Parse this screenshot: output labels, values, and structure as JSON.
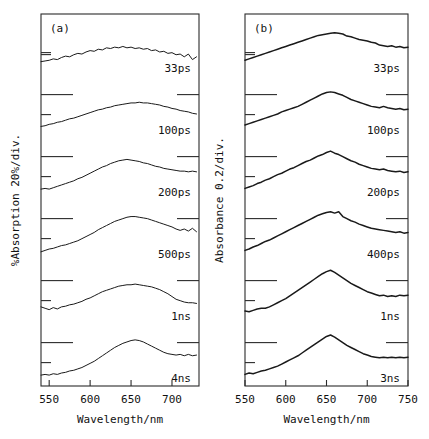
{
  "figure": {
    "background": "#ffffff",
    "ink": "#1a1a1a"
  },
  "chart_data": [
    {
      "type": "line",
      "panel_label": "(a)",
      "title": "",
      "xlabel": "Wavelength/nm",
      "ylabel": "%Absorption 20%/div.",
      "xlim": [
        540,
        733
      ],
      "xticks": [
        550,
        600,
        650,
        700
      ],
      "xticklabels": [
        "550",
        "600",
        "650",
        "700"
      ],
      "grid": false,
      "legend_position": "inline-right",
      "y_divisions": 6,
      "y_division_value": 20,
      "y_division_unit": "%",
      "series": [
        {
          "name": "33ps",
          "label": "33ps",
          "x": [
            540,
            545,
            550,
            555,
            560,
            565,
            570,
            575,
            580,
            585,
            590,
            595,
            600,
            605,
            610,
            615,
            620,
            625,
            630,
            635,
            640,
            645,
            650,
            655,
            660,
            665,
            670,
            675,
            680,
            685,
            690,
            695,
            700,
            705,
            710,
            715,
            720,
            725,
            730
          ],
          "values": [
            10,
            11,
            12,
            14,
            13,
            16,
            18,
            17,
            20,
            22,
            21,
            24,
            26,
            25,
            28,
            27,
            30,
            29,
            31,
            30,
            32,
            30,
            31,
            29,
            30,
            28,
            29,
            26,
            27,
            24,
            25,
            22,
            23,
            20,
            21,
            17,
            21,
            13,
            17
          ]
        },
        {
          "name": "100ps",
          "label": "100ps",
          "x": [
            540,
            545,
            550,
            555,
            560,
            565,
            570,
            575,
            580,
            585,
            590,
            595,
            600,
            605,
            610,
            615,
            620,
            625,
            630,
            635,
            640,
            645,
            650,
            655,
            660,
            665,
            670,
            675,
            680,
            685,
            690,
            695,
            700,
            705,
            710,
            715,
            720,
            725,
            730
          ],
          "values": [
            6,
            7,
            9,
            10,
            12,
            13,
            15,
            17,
            18,
            20,
            22,
            24,
            26,
            28,
            30,
            31,
            33,
            34,
            36,
            37,
            38,
            39,
            40,
            40,
            41,
            40,
            40,
            39,
            38,
            37,
            35,
            34,
            32,
            31,
            29,
            28,
            27,
            25,
            24
          ]
        },
        {
          "name": "200ps",
          "label": "200ps",
          "x": [
            540,
            545,
            550,
            555,
            560,
            565,
            570,
            575,
            580,
            585,
            590,
            595,
            600,
            605,
            610,
            615,
            620,
            625,
            630,
            635,
            640,
            645,
            650,
            655,
            660,
            665,
            670,
            675,
            680,
            685,
            690,
            695,
            700,
            705,
            710,
            715,
            720,
            725,
            730
          ],
          "values": [
            5,
            6,
            5,
            7,
            9,
            11,
            13,
            15,
            17,
            20,
            22,
            25,
            28,
            31,
            34,
            37,
            39,
            42,
            44,
            46,
            47,
            48,
            47,
            46,
            45,
            43,
            42,
            40,
            38,
            37,
            35,
            34,
            33,
            32,
            31,
            31,
            30,
            31,
            30
          ]
        },
        {
          "name": "500ps",
          "label": "500ps",
          "x": [
            540,
            545,
            550,
            555,
            560,
            565,
            570,
            575,
            580,
            585,
            590,
            595,
            600,
            605,
            610,
            615,
            620,
            625,
            630,
            635,
            640,
            645,
            650,
            655,
            660,
            665,
            670,
            675,
            680,
            685,
            690,
            695,
            700,
            705,
            710,
            715,
            720,
            725,
            730
          ],
          "values": [
            4,
            6,
            8,
            9,
            11,
            13,
            14,
            16,
            18,
            20,
            23,
            26,
            29,
            32,
            36,
            39,
            42,
            45,
            48,
            50,
            52,
            54,
            55,
            55,
            54,
            53,
            52,
            50,
            48,
            46,
            44,
            42,
            40,
            37,
            35,
            37,
            34,
            38,
            33
          ]
        },
        {
          "name": "1ns",
          "label": "1ns",
          "x": [
            540,
            545,
            550,
            555,
            560,
            565,
            570,
            575,
            580,
            585,
            590,
            595,
            600,
            605,
            610,
            615,
            620,
            625,
            630,
            635,
            640,
            645,
            650,
            655,
            660,
            665,
            670,
            675,
            680,
            685,
            690,
            695,
            700,
            705,
            710,
            715,
            720,
            725,
            730
          ],
          "values": [
            14,
            12,
            10,
            13,
            11,
            14,
            15,
            17,
            18,
            20,
            22,
            25,
            27,
            30,
            33,
            36,
            38,
            40,
            42,
            44,
            45,
            46,
            46,
            47,
            46,
            45,
            44,
            43,
            41,
            39,
            36,
            33,
            29,
            25,
            23,
            21,
            20,
            20,
            19
          ]
        },
        {
          "name": "4ns",
          "label": "4ns",
          "x": [
            540,
            545,
            550,
            555,
            560,
            565,
            570,
            575,
            580,
            585,
            590,
            595,
            600,
            605,
            610,
            615,
            620,
            625,
            630,
            635,
            640,
            645,
            650,
            655,
            660,
            665,
            670,
            675,
            680,
            685,
            690,
            695,
            700,
            705,
            710,
            715,
            720,
            725,
            730
          ],
          "values": [
            5,
            6,
            5,
            7,
            6,
            8,
            9,
            11,
            12,
            14,
            16,
            19,
            22,
            25,
            29,
            33,
            37,
            41,
            45,
            48,
            51,
            53,
            55,
            56,
            55,
            53,
            50,
            47,
            44,
            41,
            38,
            36,
            35,
            34,
            35,
            33,
            35,
            33,
            34
          ]
        }
      ]
    },
    {
      "type": "line",
      "panel_label": "(b)",
      "title": "",
      "xlabel": "Wavelength/nm",
      "ylabel": "Absorbance 0.2/div.",
      "xlim": [
        550,
        750
      ],
      "xticks": [
        550,
        600,
        650,
        700,
        750
      ],
      "xticklabels": [
        "550",
        "600",
        "650",
        "700",
        "750"
      ],
      "grid": false,
      "legend_position": "inline-right",
      "y_divisions": 6,
      "y_division_value": 0.2,
      "y_division_unit": "",
      "series": [
        {
          "name": "33ps",
          "label": "33ps",
          "x": [
            550,
            555,
            560,
            565,
            570,
            575,
            580,
            585,
            590,
            595,
            600,
            605,
            610,
            615,
            620,
            625,
            630,
            635,
            640,
            645,
            650,
            655,
            660,
            665,
            670,
            675,
            680,
            685,
            690,
            695,
            700,
            705,
            710,
            715,
            720,
            725,
            730,
            735,
            740,
            745,
            750
          ],
          "values": [
            12,
            14,
            16,
            18,
            20,
            22,
            24,
            26,
            28,
            30,
            32,
            34,
            36,
            38,
            40,
            42,
            44,
            46,
            48,
            49,
            50,
            51,
            52,
            51,
            50,
            47,
            46,
            44,
            42,
            41,
            40,
            38,
            37,
            34,
            33,
            32,
            33,
            31,
            32,
            30,
            31
          ]
        },
        {
          "name": "100ps",
          "label": "100ps",
          "x": [
            550,
            555,
            560,
            565,
            570,
            575,
            580,
            585,
            590,
            595,
            600,
            605,
            610,
            615,
            620,
            625,
            630,
            635,
            640,
            645,
            650,
            655,
            660,
            665,
            670,
            675,
            680,
            685,
            690,
            695,
            700,
            705,
            710,
            715,
            720,
            725,
            730,
            735,
            740,
            745,
            750
          ],
          "values": [
            8,
            10,
            12,
            14,
            16,
            18,
            20,
            22,
            24,
            27,
            29,
            31,
            33,
            35,
            38,
            41,
            44,
            47,
            50,
            53,
            55,
            56,
            55,
            53,
            51,
            48,
            45,
            43,
            41,
            39,
            37,
            35,
            34,
            33,
            35,
            33,
            32,
            31,
            32,
            30,
            31
          ]
        },
        {
          "name": "200ps",
          "label": "200ps",
          "x": [
            550,
            555,
            560,
            565,
            570,
            575,
            580,
            585,
            590,
            595,
            600,
            605,
            610,
            615,
            620,
            625,
            630,
            635,
            640,
            645,
            650,
            655,
            660,
            665,
            670,
            675,
            680,
            685,
            690,
            695,
            700,
            705,
            710,
            715,
            720,
            725,
            730,
            735,
            740,
            745,
            750
          ],
          "values": [
            6,
            8,
            10,
            13,
            15,
            18,
            20,
            23,
            26,
            28,
            31,
            34,
            36,
            39,
            42,
            45,
            47,
            50,
            53,
            55,
            58,
            60,
            57,
            55,
            52,
            49,
            46,
            44,
            41,
            39,
            37,
            35,
            34,
            33,
            34,
            32,
            31,
            30,
            31,
            29,
            30
          ]
        },
        {
          "name": "400ps",
          "label": "400ps",
          "x": [
            550,
            555,
            560,
            565,
            570,
            575,
            580,
            585,
            590,
            595,
            600,
            605,
            610,
            615,
            620,
            625,
            630,
            635,
            640,
            645,
            650,
            655,
            660,
            665,
            670,
            675,
            680,
            685,
            690,
            695,
            700,
            705,
            710,
            715,
            720,
            725,
            730,
            735,
            740,
            745,
            750
          ],
          "values": [
            6,
            8,
            11,
            13,
            16,
            19,
            21,
            24,
            27,
            30,
            33,
            36,
            39,
            42,
            45,
            48,
            51,
            54,
            57,
            59,
            61,
            62,
            60,
            62,
            55,
            52,
            49,
            47,
            44,
            42,
            40,
            38,
            37,
            36,
            35,
            34,
            33,
            32,
            33,
            31,
            32
          ]
        },
        {
          "name": "1ns",
          "label": "1ns",
          "x": [
            550,
            555,
            560,
            565,
            570,
            575,
            580,
            585,
            590,
            595,
            600,
            605,
            610,
            615,
            620,
            625,
            630,
            635,
            640,
            645,
            650,
            655,
            660,
            665,
            670,
            675,
            680,
            685,
            690,
            695,
            700,
            705,
            710,
            715,
            720,
            725,
            730,
            735,
            740,
            745,
            750
          ],
          "values": [
            8,
            7,
            9,
            11,
            12,
            12,
            14,
            17,
            20,
            23,
            26,
            30,
            34,
            38,
            42,
            46,
            50,
            54,
            58,
            62,
            65,
            67,
            64,
            60,
            56,
            52,
            48,
            45,
            42,
            39,
            36,
            34,
            32,
            30,
            31,
            29,
            30,
            29,
            31,
            30,
            31
          ]
        },
        {
          "name": "3ns",
          "label": "3ns",
          "x": [
            550,
            555,
            560,
            565,
            570,
            575,
            580,
            585,
            590,
            595,
            600,
            605,
            610,
            615,
            620,
            625,
            630,
            635,
            640,
            645,
            650,
            655,
            660,
            665,
            670,
            675,
            680,
            685,
            690,
            695,
            700,
            705,
            710,
            715,
            720,
            725,
            730,
            735,
            740,
            745,
            750
          ],
          "values": [
            6,
            8,
            7,
            9,
            11,
            12,
            14,
            16,
            18,
            21,
            24,
            27,
            30,
            33,
            37,
            41,
            45,
            49,
            53,
            57,
            61,
            63,
            60,
            56,
            52,
            48,
            45,
            42,
            39,
            36,
            34,
            32,
            31,
            30,
            31,
            30,
            31,
            30,
            31,
            30,
            31
          ]
        }
      ]
    }
  ]
}
